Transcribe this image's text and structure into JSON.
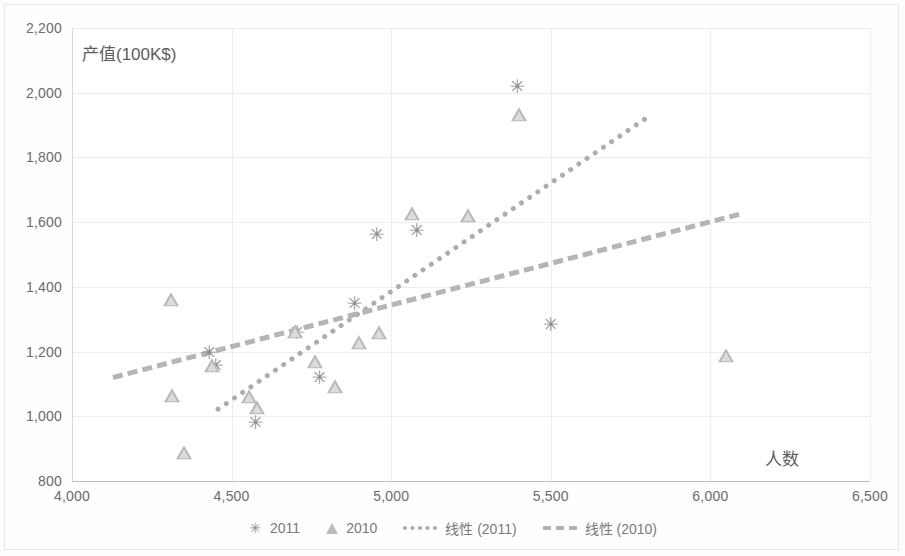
{
  "chart_data": {
    "type": "scatter",
    "title": "",
    "xlabel": "人数",
    "ylabel": "产值(100K$)",
    "xlim": [
      4000,
      6500
    ],
    "ylim": [
      800,
      2200
    ],
    "xticks": [
      "4,000",
      "4,500",
      "5,000",
      "5,500",
      "6,000",
      "6,500"
    ],
    "xtick_values": [
      4000,
      4500,
      5000,
      5500,
      6000,
      6500
    ],
    "yticks": [
      "800",
      "1,000",
      "1,200",
      "1,400",
      "1,600",
      "1,800",
      "2,000",
      "2,200"
    ],
    "ytick_values": [
      800,
      1000,
      1200,
      1400,
      1600,
      1800,
      2000,
      2200
    ],
    "grid": true,
    "legend_position": "bottom",
    "series": [
      {
        "name": "2011",
        "marker": "x-star",
        "color": "#8d8d8d",
        "points": [
          [
            4430,
            1200
          ],
          [
            4450,
            1160
          ],
          [
            4575,
            982
          ],
          [
            4705,
            1262
          ],
          [
            4775,
            1122
          ],
          [
            4885,
            1350
          ],
          [
            4955,
            1563
          ],
          [
            5080,
            1575
          ],
          [
            5395,
            2020
          ],
          [
            5500,
            1285
          ]
        ]
      },
      {
        "name": "2010",
        "marker": "triangle",
        "color": "#b9b9b9",
        "points": [
          [
            4310,
            1360
          ],
          [
            4312,
            1062
          ],
          [
            4350,
            888
          ],
          [
            4440,
            1155
          ],
          [
            4555,
            1060
          ],
          [
            4580,
            1025
          ],
          [
            4700,
            1262
          ],
          [
            4760,
            1168
          ],
          [
            4825,
            1090
          ],
          [
            4900,
            1228
          ],
          [
            4962,
            1258
          ],
          [
            5065,
            1625
          ],
          [
            5240,
            1620
          ],
          [
            5400,
            1932
          ],
          [
            6050,
            1185
          ]
        ]
      }
    ],
    "trendlines": [
      {
        "name": "线性 (2011)",
        "style": "dotted",
        "color": "#adadad",
        "x0": 4450,
        "y0": 1025,
        "x1": 5800,
        "y1": 1930
      },
      {
        "name": "线性 (2010)",
        "style": "dashed",
        "color": "#b5b5b5",
        "x0": 4130,
        "y0": 1128,
        "x1": 6090,
        "y1": 1632
      }
    ]
  },
  "legend": {
    "items": [
      {
        "label": "2011",
        "marker": "x-star"
      },
      {
        "label": "2010",
        "marker": "triangle"
      },
      {
        "label": "线性 (2011)",
        "marker": "dotted-line"
      },
      {
        "label": "线性 (2010)",
        "marker": "dashed-line"
      }
    ]
  }
}
